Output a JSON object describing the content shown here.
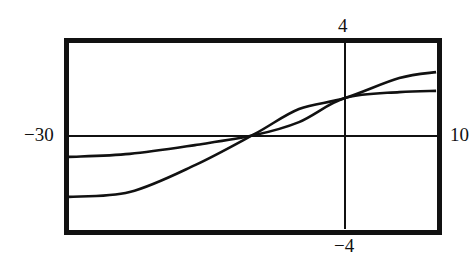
{
  "chart_data": {
    "type": "line",
    "title": "",
    "xlabel": "",
    "ylabel": "",
    "xlim": [
      -30,
      10
    ],
    "ylim": [
      -4,
      4
    ],
    "grid": false,
    "legend": null,
    "window_labels": {
      "xmin": "−30",
      "xmax": "10",
      "ymin": "−4",
      "ymax": "4"
    },
    "axes_visible": true,
    "x": [
      -30,
      -23.4,
      -16.3,
      -9.8,
      -5.0,
      0,
      5.9,
      9.9
    ],
    "series": [
      {
        "name": "curve-steep",
        "values": [
          -2.62,
          -2.41,
          -1.25,
          0.09,
          1.16,
          1.63,
          2.49,
          2.75
        ]
      },
      {
        "name": "curve-flat",
        "values": [
          -0.9,
          -0.77,
          -0.39,
          0.04,
          0.6,
          1.63,
          1.89,
          1.94
        ]
      }
    ],
    "annotations": [
      {
        "note": "curves intersect near x ≈ -10, y ≈ 0"
      },
      {
        "note": "curves intersect at x = 0, y ≈ 1.6"
      }
    ]
  },
  "style": {
    "line_color": "#111111",
    "background": "#ffffff"
  }
}
